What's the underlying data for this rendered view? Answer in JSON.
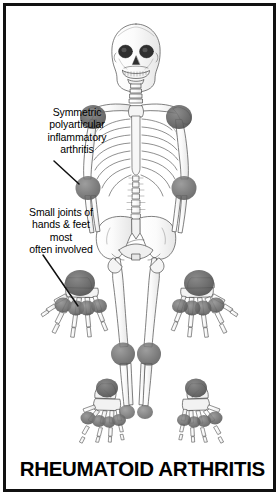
{
  "figure": {
    "title": "RHEUMATOID ARTHRITIS",
    "border_color": "#111111",
    "background_color": "#ffffff",
    "bone_line_color": "#4a4a4a",
    "joint_marker_color": "#6b6b6b",
    "text_color": "#000000"
  },
  "annotations": [
    {
      "name": "symmetric-polyarticular",
      "text": "Symmetric\npolyarticular\ninflammatory\narthritis",
      "points_to": "left-elbow-joint"
    },
    {
      "name": "small-joints",
      "text": "Small joints of\nhands & feet\nmost\noften involved",
      "points_to": "left-hand-mcp-joints"
    }
  ],
  "affected_joints": [
    {
      "label": "right shoulder",
      "region": "skeleton"
    },
    {
      "label": "left shoulder",
      "region": "skeleton"
    },
    {
      "label": "right elbow",
      "region": "skeleton"
    },
    {
      "label": "left elbow",
      "region": "skeleton"
    },
    {
      "label": "right knee",
      "region": "skeleton"
    },
    {
      "label": "left knee",
      "region": "skeleton"
    },
    {
      "label": "right ankle",
      "region": "skeleton"
    },
    {
      "label": "left ankle",
      "region": "skeleton"
    },
    {
      "label": "wrist",
      "region": "left hand detail"
    },
    {
      "label": "metacarpophalangeal joints",
      "region": "left hand detail"
    },
    {
      "label": "wrist",
      "region": "right hand detail"
    },
    {
      "label": "metacarpophalangeal joints",
      "region": "right hand detail"
    },
    {
      "label": "ankle",
      "region": "left foot detail"
    },
    {
      "label": "metatarsophalangeal joints",
      "region": "left foot detail"
    },
    {
      "label": "ankle",
      "region": "right foot detail"
    },
    {
      "label": "metatarsophalangeal joints",
      "region": "right foot detail"
    }
  ]
}
